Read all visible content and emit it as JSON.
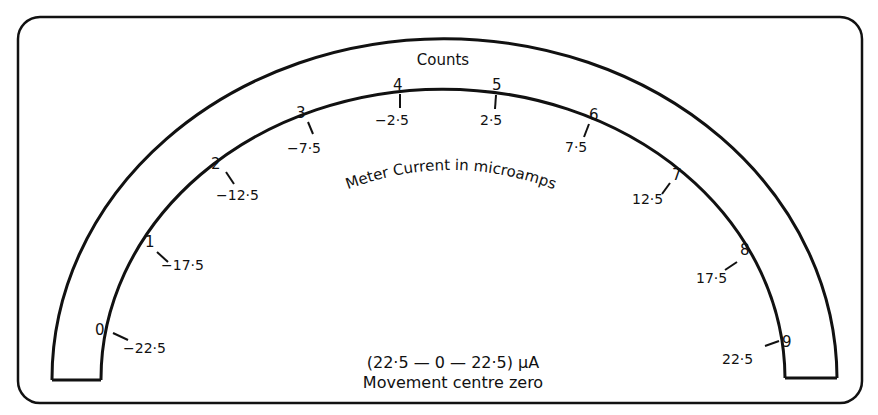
{
  "diagram": {
    "type": "analog-meter-scale",
    "scale_title": "Counts",
    "arc_caption": "Meter Current in microamps",
    "range_caption": "(22·5 — 0 — 22·5) μA",
    "movement_caption": "Movement centre zero",
    "colors": {
      "ink": "#111111",
      "background": "#ffffff"
    }
  },
  "ticks": [
    {
      "count": "0",
      "current": "−22·5"
    },
    {
      "count": "1",
      "current": "−17·5"
    },
    {
      "count": "2",
      "current": "−12·5"
    },
    {
      "count": "3",
      "current": "−7·5"
    },
    {
      "count": "4",
      "current": "−2·5"
    },
    {
      "count": "5",
      "current": "2·5"
    },
    {
      "count": "6",
      "current": "7·5"
    },
    {
      "count": "7",
      "current": "12·5"
    },
    {
      "count": "8",
      "current": "17·5"
    },
    {
      "count": "9",
      "current": "22·5"
    }
  ]
}
